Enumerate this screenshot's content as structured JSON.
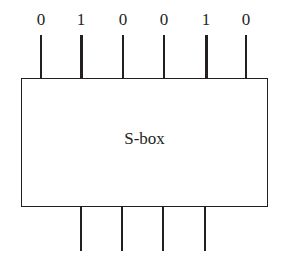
{
  "diagram": {
    "box_label": "S-box",
    "inputs": [
      {
        "bit": "0",
        "x": 41,
        "thick": false
      },
      {
        "bit": "1",
        "x": 81,
        "thick": true
      },
      {
        "bit": "0",
        "x": 123,
        "thick": false
      },
      {
        "bit": "0",
        "x": 164,
        "thick": false
      },
      {
        "bit": "1",
        "x": 206,
        "thick": true
      },
      {
        "bit": "0",
        "x": 246,
        "thick": false
      }
    ],
    "outputs": [
      {
        "x": 81
      },
      {
        "x": 122
      },
      {
        "x": 163
      },
      {
        "x": 205
      }
    ],
    "line_color": "#231f20"
  }
}
